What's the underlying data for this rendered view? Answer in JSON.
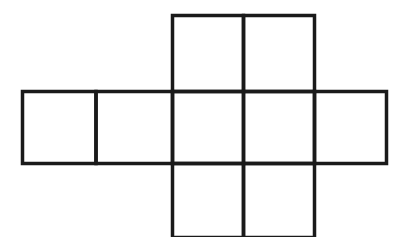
{
  "diagram": {
    "stroke_color": "#1a1a1a",
    "background": "#ffffff",
    "cells": [
      {
        "row": 0,
        "col": 2
      },
      {
        "row": 0,
        "col": 3
      },
      {
        "row": 1,
        "col": 0
      },
      {
        "row": 1,
        "col": 1
      },
      {
        "row": 1,
        "col": 2
      },
      {
        "row": 1,
        "col": 3
      },
      {
        "row": 1,
        "col": 4
      },
      {
        "row": 2,
        "col": 2
      },
      {
        "row": 2,
        "col": 3
      }
    ]
  }
}
